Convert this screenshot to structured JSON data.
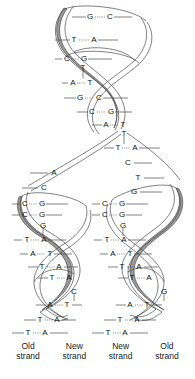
{
  "figure": {
    "colors": {
      "old_strand_ribbon": "#9a9a9a",
      "new_strand_ribbon": "#ffffff",
      "outline": "#4a4a4a",
      "text": "#111111",
      "background": "#ffffff"
    }
  },
  "labels": [
    {
      "line1": "Old",
      "line2": "strand"
    },
    {
      "line1": "New",
      "line2": "strand"
    },
    {
      "line1": "New",
      "line2": "strand"
    },
    {
      "line1": "Old",
      "line2": "strand"
    }
  ],
  "parent_duplex": {
    "region": "unreplicated double helix above the fork",
    "pairs": [
      {
        "left": "G",
        "right": "C",
        "y": 17
      },
      {
        "left": "T",
        "right": "A",
        "y": 40
      },
      {
        "left": "C",
        "right": "G",
        "y": 59
      },
      {
        "left": "A",
        "right": "T",
        "y": 83
      },
      {
        "left": "G",
        "right": "C",
        "y": 98
      },
      {
        "left": "C",
        "right": "G",
        "y": 112
      },
      {
        "left": "A",
        "right": "T",
        "y": 125
      },
      {
        "left": "T",
        "right": "A",
        "y": 148
      }
    ],
    "single_bases": [
      {
        "base": "T",
        "y": 70
      },
      {
        "base": "T",
        "y": 135
      }
    ]
  },
  "left_daughter": {
    "region": "left replicated duplex: old template strand plus new strand",
    "unpaired": [
      {
        "base": "A",
        "y": 173
      },
      {
        "base": "C",
        "y": 188
      }
    ],
    "pairs": [
      {
        "left": "C",
        "right": "G",
        "y": 204
      },
      {
        "left": "C",
        "right": "G",
        "y": 215
      },
      {
        "left": "T",
        "right": "A",
        "y": 240
      },
      {
        "left": "A",
        "right": "T",
        "y": 254
      },
      {
        "left": "T",
        "right": "A",
        "y": 267
      },
      {
        "left": "T",
        "right": "A",
        "y": 278
      },
      {
        "left": "A",
        "right": "T",
        "y": 305
      },
      {
        "left": "T",
        "right": "A",
        "y": 320
      },
      {
        "left": "T",
        "right": "A",
        "y": 333
      }
    ],
    "single_bases": [
      {
        "base": "G",
        "y": 226
      },
      {
        "base": "C",
        "y": 292
      }
    ]
  },
  "right_daughter": {
    "region": "right replicated duplex: new strand plus old template strand",
    "unpaired": [
      {
        "base": "C",
        "y": 163
      },
      {
        "base": "T",
        "y": 178
      },
      {
        "base": "G",
        "y": 192
      }
    ],
    "pairs": [
      {
        "left": "C",
        "right": "G",
        "y": 204
      },
      {
        "left": "C",
        "right": "G",
        "y": 215
      },
      {
        "left": "T",
        "right": "A",
        "y": 240
      },
      {
        "left": "A",
        "right": "T",
        "y": 254
      },
      {
        "left": "T",
        "right": "A",
        "y": 267
      },
      {
        "left": "T",
        "right": "A",
        "y": 278
      },
      {
        "left": "A",
        "right": "T",
        "y": 305
      },
      {
        "left": "T",
        "right": "A",
        "y": 320
      },
      {
        "left": "T",
        "right": "A",
        "y": 333
      }
    ],
    "single_bases": [
      {
        "base": "G",
        "y": 226
      },
      {
        "base": "G",
        "y": 292
      }
    ]
  }
}
